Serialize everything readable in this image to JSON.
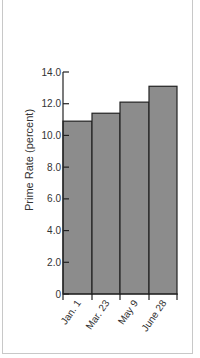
{
  "chart_data": {
    "type": "bar",
    "title": "",
    "xlabel": "",
    "ylabel": "Prime Rate (percent)",
    "categories": [
      "Jan. 1",
      "Mar. 23",
      "May 9",
      "June 28"
    ],
    "values": [
      10.9,
      11.4,
      12.1,
      13.1
    ],
    "ylim": [
      0,
      14
    ],
    "yticks": [
      "0",
      "2.0",
      "4.0",
      "6.0",
      "8.0",
      "10.0",
      "12.0",
      "14.0"
    ],
    "grid": false,
    "legend": null,
    "bar_color": "#8c8c8c",
    "edge_color": "#222222"
  }
}
